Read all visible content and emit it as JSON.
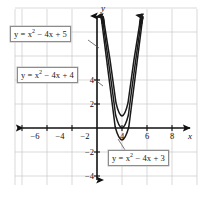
{
  "figure": {
    "kind": "coordinate-plane-graph",
    "background_color": "#ffffff",
    "grid_color": "#c8c8c8",
    "axis_color": "#111111",
    "curve_color": "#1a1a1a"
  },
  "axes": {
    "x_axis_name": "x",
    "y_axis_name": "y",
    "x_ticks": [
      {
        "label": "−6",
        "value": -6
      },
      {
        "label": "−4",
        "value": -4
      },
      {
        "label": "−2",
        "value": -2
      },
      {
        "label": "4",
        "value": 4
      },
      {
        "label": "6",
        "value": 6
      },
      {
        "label": "8",
        "value": 8
      }
    ],
    "y_ticks": [
      {
        "label": "4",
        "value": 4
      },
      {
        "label": "2",
        "value": 2
      },
      {
        "label": "−2",
        "value": -2
      },
      {
        "label": "−4",
        "value": -4
      }
    ]
  },
  "callouts": [
    {
      "id": "label-5",
      "text_html": "y = x<sup>2</sup> − 4x + 5",
      "text": "y = x² − 4x + 5"
    },
    {
      "id": "label-4",
      "text_html": "y = x<sup>2</sup> − 4x + 4",
      "text": "y = x² − 4x + 4"
    },
    {
      "id": "label-3",
      "text_html": "y = x<sup>2</sup> − 4x + 3",
      "text": "y = x² − 4x + 3"
    }
  ],
  "chart_data": {
    "type": "line",
    "title": "",
    "xlabel": "x",
    "ylabel": "y",
    "xlim": [
      -7.2,
      8.8
    ],
    "ylim": [
      -5.5,
      6.5
    ],
    "grid": true,
    "grid_step": 2,
    "legend": "inline-callout-boxes",
    "series": [
      {
        "name": "y = x² − 4x + 5",
        "equation": "y = x^2 - 4x + 5",
        "vertex": [
          2,
          1
        ],
        "roots": [],
        "y_intercept": 5,
        "x": [
          -0.5,
          0,
          0.5,
          1,
          1.5,
          2,
          2.5,
          3,
          3.5,
          4,
          4.5
        ],
        "y": [
          7.25,
          5,
          3.25,
          2,
          1.25,
          1,
          1.25,
          2,
          3.25,
          5,
          7.25
        ]
      },
      {
        "name": "y = x² − 4x + 4",
        "equation": "y = x^2 - 4x + 4",
        "vertex": [
          2,
          0
        ],
        "roots": [
          2
        ],
        "y_intercept": 4,
        "x": [
          -0.5,
          0,
          0.5,
          1,
          1.5,
          2,
          2.5,
          3,
          3.5,
          4,
          4.5
        ],
        "y": [
          6.25,
          4,
          2.25,
          1,
          0.25,
          0,
          0.25,
          1,
          2.25,
          4,
          6.25
        ]
      },
      {
        "name": "y = x² − 4x + 3",
        "equation": "y = x^2 - 4x + 3",
        "vertex": [
          2,
          -1
        ],
        "roots": [
          1,
          3
        ],
        "y_intercept": 3,
        "x": [
          -0.5,
          0,
          0.5,
          1,
          1.5,
          2,
          2.5,
          3,
          3.5,
          4,
          4.5
        ],
        "y": [
          5.25,
          3,
          1.25,
          0,
          -0.75,
          -1,
          -0.75,
          0,
          1.25,
          3,
          5.25
        ]
      }
    ]
  }
}
